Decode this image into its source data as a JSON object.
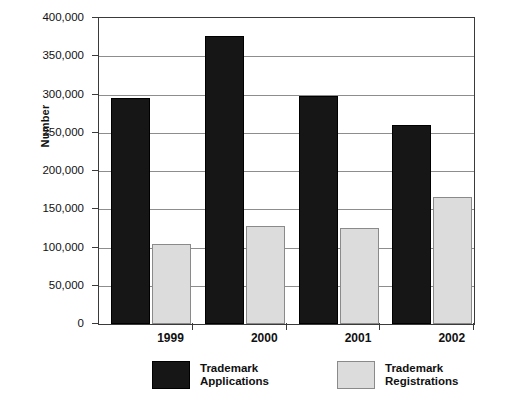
{
  "chart_data": {
    "type": "bar",
    "title": "",
    "xlabel": "",
    "ylabel": "Number",
    "categories": [
      "1999",
      "2000",
      "2001",
      "2002"
    ],
    "series": [
      {
        "name": "Trademark Applications",
        "name_line1": "Trademark",
        "name_line2": "Applications",
        "color": "#161616",
        "values": [
          296000,
          376000,
          298000,
          260000
        ]
      },
      {
        "name": "Trademark Registrations",
        "name_line1": "Trademark",
        "name_line2": "Registrations",
        "color": "#dcdcdc",
        "values": [
          104000,
          128000,
          125000,
          166000
        ]
      }
    ],
    "ylim": [
      0,
      400000
    ],
    "ytick_values": [
      0,
      50000,
      100000,
      150000,
      200000,
      250000,
      300000,
      350000,
      400000
    ],
    "ytick_labels": [
      "0",
      "50,000",
      "100,000",
      "150,000",
      "200,000",
      "250,000",
      "300,000",
      "350,000",
      "400,000"
    ],
    "grid": true,
    "grid_axis": "y",
    "legend_position": "bottom",
    "axis_color": "#3a3a3a",
    "grid_color": "#8d8d8d",
    "background": "#ffffff"
  }
}
